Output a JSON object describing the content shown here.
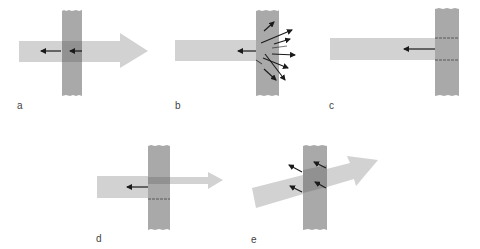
{
  "colors": {
    "beam": "#d2d2d2",
    "medium": "#a9a9a9",
    "overlap": "#909090",
    "vector": "#1a1a1a",
    "label": "#444444"
  },
  "panels": [
    {
      "id": "a",
      "label": "a",
      "description": "Transmission: beam passes through medium with reflections at both surfaces"
    },
    {
      "id": "b",
      "label": "b",
      "description": "Scattering: beam scattered in many directions at the medium"
    },
    {
      "id": "c",
      "label": "c",
      "description": "Absorption/reflection: beam stops at medium with surface reflection"
    },
    {
      "id": "d",
      "label": "d",
      "description": "Partial transmission: attenuated beam continues through medium"
    },
    {
      "id": "e",
      "label": "e",
      "description": "Refraction: oblique beam passes through medium"
    }
  ]
}
